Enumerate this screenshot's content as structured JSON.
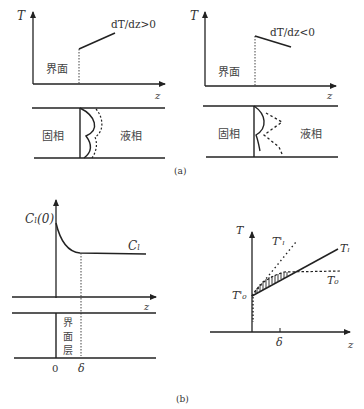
{
  "panel_a": {
    "caption": "(a)",
    "left": {
      "y_axis": "T",
      "x_axis": "z",
      "gradient_label": "dT/dz>0",
      "interface_label": "界面",
      "solid_label": "固相",
      "liquid_label": "液相"
    },
    "right": {
      "y_axis": "T",
      "x_axis": "z",
      "gradient_label": "dT/dz<0",
      "interface_label": "界面",
      "solid_label": "固相",
      "liquid_label": "液相"
    }
  },
  "panel_b": {
    "caption": "(b)",
    "left": {
      "curve_start_label": "Cₗ(0)",
      "curve_label": "Cₗ",
      "x_axis": "z",
      "layer_label_1": "界",
      "layer_label_2": "面",
      "layer_label_3": "层",
      "origin_label": "0",
      "delta_label": "δ"
    },
    "right": {
      "y_axis": "T",
      "x_axis": "z",
      "tl_prime_label": "T'ₗ",
      "tl_label": "Tₗ",
      "t0_label": "T₀",
      "t0_prime_label": "T'₀",
      "delta_label": "δ"
    }
  }
}
